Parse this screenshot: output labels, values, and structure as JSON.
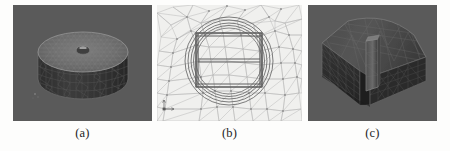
{
  "figure": {
    "layout": "three-panel-row",
    "background_color": "#fdfdfc",
    "panels": [
      {
        "id": "a",
        "caption": "(a)",
        "description": "3D tetrahedral mesh of a solid cylinder with a small central bore on the top face",
        "background_color": "#5a5a5a",
        "mesh_color": "#8a8a8a",
        "body_color": "#3a3a3a",
        "top_face_color": "#707070",
        "render_type": "3d-mesh"
      },
      {
        "id": "b",
        "caption": "(b)",
        "description": "2D triangular surface mesh cross-section showing concentric circular boundaries around an H-shaped inner structure",
        "background_color": "#f0f0ee",
        "mesh_color": "#a9a9a9",
        "feature_color": "#6d6d6d",
        "axis_marker": "xy-axis-tripod",
        "render_type": "2d-mesh"
      },
      {
        "id": "c",
        "caption": "(c)",
        "description": "3D tetrahedral mesh of a curved wedge block with a raised rectangular rib on the front face",
        "background_color": "#5a5a5a",
        "mesh_color": "#6f6f6f",
        "body_color": "#2f2f2f",
        "render_type": "3d-mesh"
      }
    ]
  }
}
